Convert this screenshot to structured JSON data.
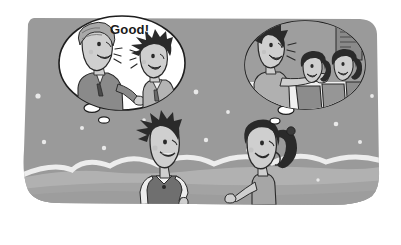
{
  "illustration": {
    "title": "Cartoon of two students talking with thought bubbles",
    "style": "grayscale-comic",
    "canvas": {
      "width": 401,
      "height": 245
    },
    "colors": {
      "page_background": "#ffffff",
      "panel_grey": "#9a9a9a",
      "panel_grey_dark": "#8e8e8e",
      "snow_white": "#f4f4f4",
      "bubble_fill": "#ffffff",
      "bubble_stroke": "#1e1e1e",
      "ink": "#1e1e1e",
      "skin": "#cfcfcf",
      "hair_dark": "#2a2a2a",
      "hair_grey": "#a8a8a8",
      "vest_dark": "#6f6f6f",
      "shirt_light": "#ededed",
      "suit_grey": "#8a8a8a"
    }
  },
  "speech": {
    "good_label": "Good!"
  },
  "bubbles": [
    {
      "id": "left-thought-bubble",
      "owner": "boy",
      "description": "Boy imagines a teacher in a suit praising him",
      "characters": [
        "teacher-in-suit",
        "spiky-haired-boy"
      ],
      "text": "Good!"
    },
    {
      "id": "right-thought-bubble",
      "owner": "girl",
      "description": "Girl imagines the boy presenting to two seated classmates",
      "characters": [
        "spiky-haired-boy-presenting",
        "seated-girl-1",
        "seated-girl-2"
      ],
      "text": ""
    }
  ],
  "characters": [
    {
      "id": "boy",
      "name": "Boy with spiky hair",
      "hair": "black spiky",
      "outfit": "white shirt with dark vest",
      "expression": "smiling",
      "position": "bottom-left-center"
    },
    {
      "id": "girl",
      "name": "Girl with ponytail",
      "hair": "black ponytail",
      "outfit": "plain top",
      "expression": "smiling, gesturing",
      "position": "bottom-right-center"
    }
  ],
  "background": {
    "type": "snow-hills",
    "sparkle_count": 14,
    "hill_line": "white wavy snow drift across middle"
  }
}
